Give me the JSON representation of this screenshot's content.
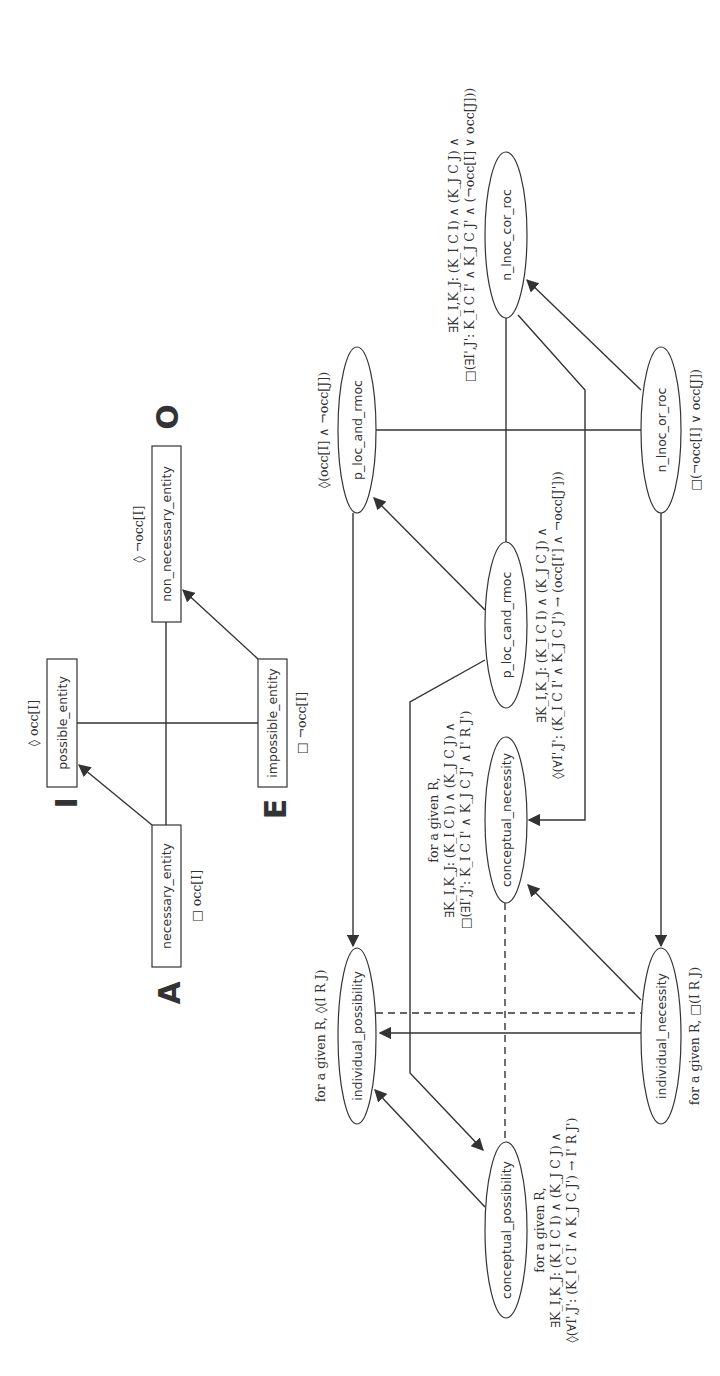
{
  "square_of_opposition": {
    "corners": {
      "A": "A",
      "I": "I",
      "E": "E",
      "O": "O"
    },
    "nodes": {
      "possible_entity": {
        "label": "possible_entity",
        "formula": "◊ occ[I]"
      },
      "necessary_entity": {
        "label": "necessary_entity",
        "formula": "□ occ[I]"
      },
      "impossible_entity": {
        "label": "impossible_entity",
        "formula": "□ ¬occ[I]"
      },
      "non_necessary_entity": {
        "label": "non_necessary_entity",
        "formula": "◊ ¬occ[I]"
      }
    }
  },
  "relation_lattice": {
    "nodes": {
      "p_loc_and_rmoc": {
        "label": "p_loc_and_rmoc",
        "formula": "◊(occ[I] ∧ ¬occ[J])"
      },
      "n_lnoc_cor_roc": {
        "label": "n_lnoc_cor_roc",
        "formula_line1": "∃K_I,K_J: (K_I C I) ∧ (K_J C J) ∧",
        "formula_line2": "□(∃I',J': K_I C I' ∧ K_J C J' ∧ (¬occ[I] ∨ occ[J]))"
      },
      "n_lnoc_or_roc": {
        "label": "n_lnoc_or_roc",
        "formula": "□(¬occ[I] ∨ occ[J])"
      },
      "p_loc_cand_rmoc": {
        "label": "p_loc_cand_rmoc",
        "formula_line1": "∃K_I,K_J: (K_I C I) ∧ (K_J C J) ∧",
        "formula_line2": "◊(∀I',J': (K_I C I' ∧ K_J C J') → (occ[I'] ∧ ¬occ[J']))"
      },
      "conceptual_necessity": {
        "label": "conceptual_necessity",
        "formula_line1": "for a given R,",
        "formula_line2": "∃K_I,K_J: (K_I C I) ∧ (K_J C J) ∧",
        "formula_line3": "□(∃I',J': K_I C I' ∧ K_J C J' ∧ I' R J')"
      },
      "individual_possibility": {
        "label": "individual_possibility",
        "formula": "for a given R, ◊(I R J)"
      },
      "individual_necessity": {
        "label": "individual_necessity",
        "formula": "for a given R, □(I R J)"
      },
      "conceptual_possibility": {
        "label": "conceptual_possibility",
        "formula_line1": "for a given R,",
        "formula_line2": "∃K_I,K_J: (K_I C I) ∧ (K_J C J) ∧",
        "formula_line3": "◊(∀I',J': (K_I C I' ∧ K_J C J') → I' R J')"
      }
    }
  }
}
